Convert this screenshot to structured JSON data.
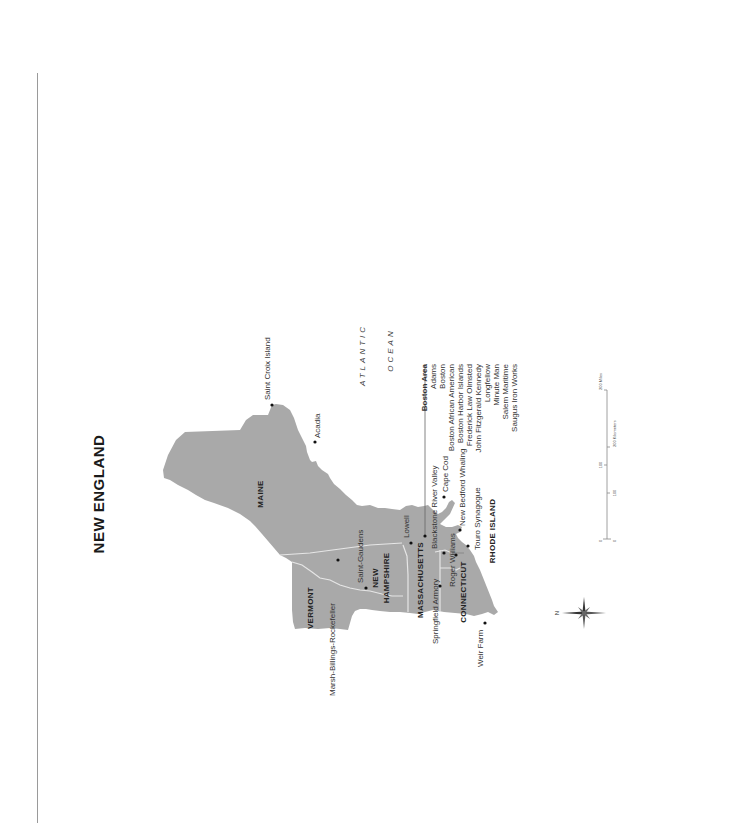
{
  "title": "NEW ENGLAND",
  "colors": {
    "land": "#a9a9a9",
    "border": "#e6e6e6",
    "text": "#2a2a2a",
    "background": "#ffffff"
  },
  "orientation": {
    "north_direction": "left",
    "compass_label": "N"
  },
  "ocean_label": {
    "line1": "ATLANTIC",
    "line2": "OCEAN"
  },
  "states": {
    "maine": "MAINE",
    "new_hampshire_1": "NEW",
    "new_hampshire_2": "HAMPSHIRE",
    "vermont": "VERMONT",
    "massachusetts": "MASSACHUSETTS",
    "connecticut": "CONNECTICUT",
    "rhode_island": "RHODE ISLAND"
  },
  "sites": {
    "saint_croix": "Saint Croix Island",
    "acadia": "Acadia",
    "saint_gaudens": "Saint-Gaudens",
    "marsh_billings": "Marsh-Billings-Rockefeller",
    "lowell": "Lowell",
    "blackstone": "Blackstone River Valley",
    "cape_cod": "Cape Cod",
    "new_bedford": "New Bedford Whaling",
    "touro": "Touro Synagogue",
    "roger_williams": "Roger Williams",
    "springfield": "Springfield Armory",
    "weir_farm": "Weir Farm"
  },
  "boston_area": {
    "heading": "Boston Area",
    "items": [
      "Adams",
      "Boston",
      "Boston African American",
      "Boston Harbor Islands",
      "Frederick Law Olmsted",
      "John Fitzgerald Kennedy",
      "Longfellow",
      "Minute Man",
      "Salem Maritime",
      "Saugus Iron Works"
    ]
  },
  "scale_bar": {
    "miles_0": "0",
    "miles_100": "100",
    "miles_200": "200 Miles",
    "km_0": "0",
    "km_100": "100",
    "km_200": "200 Kilometers"
  }
}
